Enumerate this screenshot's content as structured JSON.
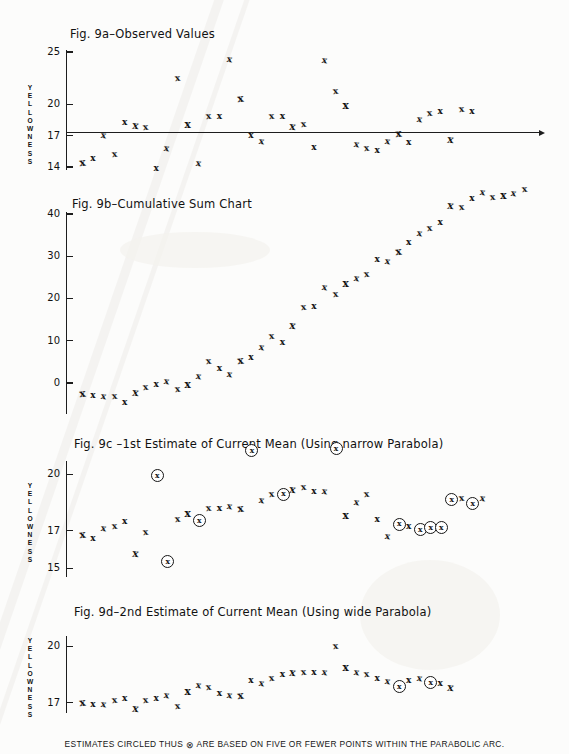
{
  "figure": {
    "footer_note_before": "ESTIMATES  CIRCLED THUS",
    "footer_symbol": "⊗",
    "footer_note_after": "ARE  BASED  ON  FIVE OR  FEWER  POINTS  WITHIN  THE  PARABOLIC  ARC.",
    "point_marker": "x",
    "circled_marker": "x",
    "axis_label": [
      "Y",
      "E",
      "L",
      "L",
      "O",
      "W",
      "N",
      "E",
      "S",
      "S"
    ],
    "axis_label_text": "YELLOWNESS",
    "ink_color": "#151515"
  },
  "chart_data": [
    {
      "type": "scatter",
      "id": "fig-9a",
      "title": "Fig. 9a–Observed Values",
      "ylabel": "YELLOWNESS",
      "xlabel": "",
      "yticks": [
        25,
        20,
        17,
        14
      ],
      "ylim": [
        13.2,
        25.8
      ],
      "xlim": [
        0,
        44
      ],
      "grid": false,
      "baseline": 17,
      "baseline_visible": true,
      "x": [
        1,
        2,
        3,
        4,
        5,
        6,
        7,
        8,
        9,
        10,
        11,
        12,
        13,
        14,
        15,
        16,
        17,
        18,
        19,
        20,
        21,
        22,
        23,
        24,
        25,
        26,
        27,
        28,
        29,
        30,
        31,
        32,
        33,
        34,
        35,
        36,
        37,
        38,
        39,
        40,
        41,
        42
      ],
      "values": [
        14.4,
        14.8,
        17.0,
        15.2,
        18.3,
        18.0,
        17.8,
        13.9,
        15.8,
        22.5,
        18.1,
        14.3,
        18.8,
        18.8,
        24.3,
        20.6,
        17.0,
        16.4,
        18.8,
        18.8,
        17.9,
        18.1,
        15.9,
        24.2,
        21.2,
        19.9,
        16.2,
        15.8,
        15.6,
        16.4,
        17.2,
        16.3,
        18.5,
        19.1,
        19.3,
        16.6,
        19.5,
        19.3
      ]
    },
    {
      "type": "scatter",
      "id": "fig-9b",
      "title": "Fig. 9b–Cumulative Sum Chart",
      "ylabel": "",
      "xlabel": "",
      "yticks": [
        40,
        30,
        20,
        10,
        0
      ],
      "ylim": [
        -6,
        46
      ],
      "xlim": [
        0,
        44
      ],
      "grid": false,
      "x": [
        1,
        2,
        3,
        4,
        5,
        6,
        7,
        8,
        9,
        10,
        11,
        12,
        13,
        14,
        15,
        16,
        17,
        18,
        19,
        20,
        21,
        22,
        23,
        24,
        25,
        26,
        27,
        28,
        29,
        30,
        31,
        32,
        33,
        34,
        35,
        36,
        37,
        38,
        39,
        40,
        41,
        42,
        43
      ],
      "values": [
        -2.6,
        -3.1,
        -3.2,
        -3.3,
        -4.6,
        -2.3,
        -1.0,
        -0.3,
        0.3,
        -1.6,
        -0.4,
        1.4,
        5.0,
        3.5,
        2.1,
        5.4,
        5.9,
        8.3,
        11.0,
        9.6,
        13.7,
        17.9,
        18.1,
        22.6,
        21.0,
        23.5,
        24.8,
        25.6,
        29.2,
        28.7,
        31.1,
        33.3,
        35.3,
        36.6,
        38.0,
        42.0,
        41.5,
        43.6,
        45.0,
        43.9,
        44.3,
        44.8,
        45.8
      ]
    },
    {
      "type": "scatter",
      "id": "fig-9c",
      "title": "Fig. 9c –1st Estimate of Current Mean (Using narrow Parabola)",
      "ylabel": "YELLOWNESS",
      "xlabel": "",
      "yticks": [
        20,
        17,
        15
      ],
      "ylim": [
        14.2,
        21.6
      ],
      "xlim": [
        0,
        44
      ],
      "grid": false,
      "x": [
        1,
        2,
        3,
        4,
        5,
        6,
        7,
        8,
        9,
        10,
        11,
        12,
        13,
        14,
        15,
        16,
        17,
        18,
        19,
        20,
        21,
        22,
        23,
        24,
        25,
        26,
        27,
        28,
        29,
        30,
        31,
        32,
        33,
        34,
        35,
        36,
        37,
        38,
        39,
        40,
        41,
        42
      ],
      "values": [
        16.8,
        16.6,
        17.1,
        17.2,
        17.5,
        15.8,
        16.9,
        20.0,
        15.4,
        17.6,
        17.9,
        17.6,
        18.2,
        18.2,
        18.3,
        18.2,
        21.3,
        18.6,
        18.9,
        19.0,
        19.2,
        19.3,
        19.1,
        19.1,
        21.4,
        17.8,
        18.5,
        18.9,
        17.6,
        16.7,
        17.4,
        17.2,
        17.1,
        17.2,
        17.2,
        18.7,
        18.7,
        18.5,
        18.7
      ],
      "circled_x": [
        8,
        9,
        12,
        17,
        20,
        25,
        31,
        33,
        34,
        35,
        36,
        38,
        40,
        42
      ],
      "circled_note": "circled estimates are based on five or fewer points within the parabolic arc"
    },
    {
      "type": "scatter",
      "id": "fig-9d",
      "title": "Fig. 9d–2nd Estimate of Current Mean (Using wide Parabola)",
      "ylabel": "YELLOWNESS",
      "xlabel": "",
      "yticks": [
        20,
        17
      ],
      "ylim": [
        16.0,
        21.2
      ],
      "xlim": [
        0,
        44
      ],
      "grid": false,
      "x": [
        1,
        2,
        3,
        4,
        5,
        6,
        7,
        8,
        9,
        10,
        11,
        12,
        13,
        14,
        15,
        16,
        17,
        18,
        19,
        20,
        21,
        22,
        23,
        24,
        25,
        26,
        27,
        28,
        29,
        30,
        31,
        32,
        33,
        34,
        35,
        36,
        37,
        38,
        39,
        40,
        41,
        42
      ],
      "values": [
        17.0,
        16.9,
        16.9,
        17.1,
        17.2,
        16.7,
        17.1,
        17.2,
        17.4,
        16.8,
        17.6,
        17.9,
        17.8,
        17.5,
        17.4,
        17.4,
        18.2,
        18.0,
        18.3,
        18.5,
        18.6,
        18.6,
        18.6,
        18.6,
        20.0,
        18.9,
        18.6,
        18.5,
        18.3,
        18.1,
        17.9,
        18.2,
        18.3,
        18.1,
        18.0,
        17.8
      ],
      "circled_x": [
        31,
        34
      ]
    }
  ]
}
